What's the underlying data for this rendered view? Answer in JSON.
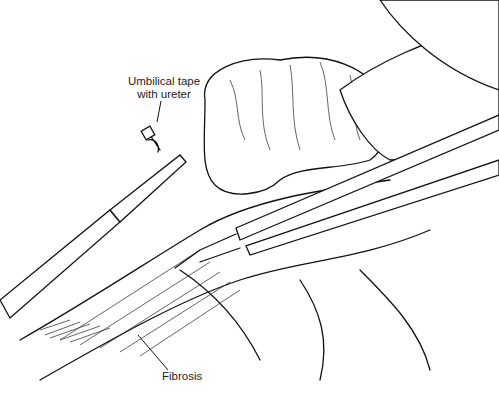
{
  "figure": {
    "labels": {
      "umbilical_tape": "Umbilical tape\nwith ureter",
      "umbilical_tape_line1": "Umbilical tape",
      "umbilical_tape_line2": "with ureter",
      "fibrosis": "Fibrosis"
    }
  }
}
